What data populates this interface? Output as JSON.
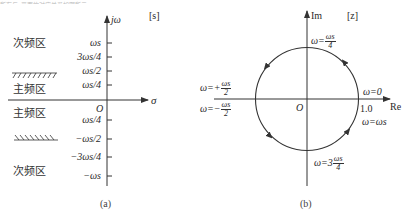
{
  "top_partial_text": "所有与z平面的对应关系如图所示",
  "diagram_a": {
    "plane_label": "[s]",
    "vertical_axis_label": "jω",
    "horizontal_axis_label": "σ",
    "origin_label": "O",
    "ticks": [
      {
        "label": "ωs",
        "value": 1.0
      },
      {
        "label": "3ωs/4",
        "value": 0.75
      },
      {
        "label": "ωs/2",
        "value": 0.5
      },
      {
        "label": "ωs/4",
        "value": 0.25
      },
      {
        "label": "ωs/4",
        "value": -0.25
      },
      {
        "label": "−ωs/2",
        "value": -0.5
      },
      {
        "label": "−3ωs/4",
        "value": -0.75
      },
      {
        "label": "−ωs",
        "value": -1.0
      }
    ],
    "regions": [
      {
        "label": "次频区",
        "position": "upper"
      },
      {
        "label": "主频区",
        "position": "upper-main"
      },
      {
        "label": "主频区",
        "position": "lower-main"
      },
      {
        "label": "次频区",
        "position": "lower"
      }
    ],
    "caption": "(a)"
  },
  "diagram_b": {
    "plane_label": "[z]",
    "vertical_axis_label": "Im",
    "horizontal_axis_label": "Re",
    "origin_label": "O",
    "unit_label": "1.0",
    "annotations": [
      {
        "id": "top",
        "prefix": "ω=",
        "num": "ωs",
        "den": "4"
      },
      {
        "id": "zero",
        "text": "ω=0"
      },
      {
        "id": "ws",
        "text": "ω=ωs"
      },
      {
        "id": "left-plus",
        "prefix": "ω=+",
        "num": "ωs",
        "den": "2"
      },
      {
        "id": "left-minus",
        "prefix": "ω=−",
        "num": "ωs",
        "den": "2"
      },
      {
        "id": "bottom",
        "prefix": "ω=3",
        "num": "ωs",
        "den": "4"
      }
    ],
    "caption": "(b)"
  },
  "colors": {
    "line": "#333333",
    "text": "#2a2a2a",
    "background": "#ffffff"
  }
}
